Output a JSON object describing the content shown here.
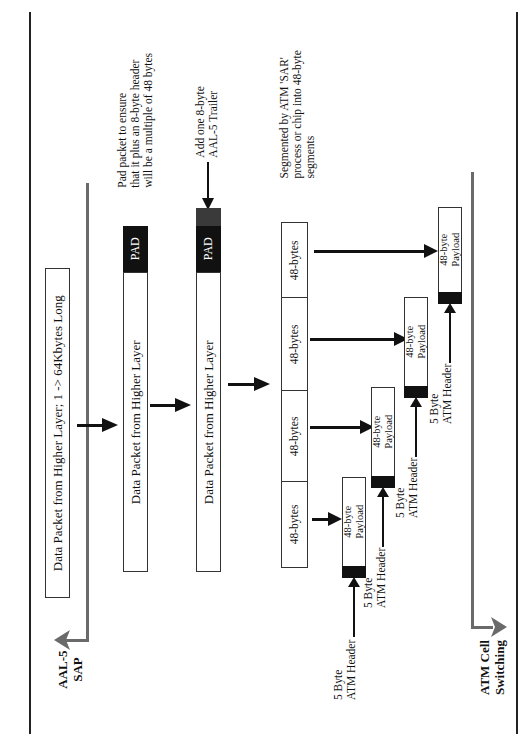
{
  "diagram": {
    "type": "AAL-5 segmentation and reassembly flow (rotated 90° counter-clockwise)",
    "orientation": "rotated-ccw",
    "endpoints": {
      "top": {
        "label_line1": "AAL-5",
        "label_line2": "SAP"
      },
      "bottom": {
        "label_line1": "ATM Cell",
        "label_line2": "Switching"
      }
    },
    "annotations": {
      "pad_note": {
        "line1": "Pad packet to ensure",
        "line2": "that it plus an 8-byte header",
        "line3": "will be a multiple of 48 bytes"
      },
      "trailer_note": {
        "line1": "Add one 8-byte",
        "line2": "AAL-5 Trailer"
      },
      "sar_note": {
        "line1": "Segmented by ATM 'SAR'",
        "line2": "process or chip into 48-byte",
        "line3": "segments"
      }
    },
    "stages": [
      {
        "id": "original",
        "label": "Data Packet from Higher Layer; 1 -> 64Kbytes Long"
      },
      {
        "id": "padded",
        "label": "Data Packet from Higher Layer",
        "pad_label": "PAD"
      },
      {
        "id": "trailered",
        "label": "Data Packet from Higher Layer",
        "pad_label": "PAD",
        "trailer": "AAL-5 Trailer"
      }
    ],
    "segments": [
      {
        "label": "48-bytes"
      },
      {
        "label": "48-bytes"
      },
      {
        "label": "48-bytes"
      },
      {
        "label": "48-bytes"
      }
    ],
    "cells": [
      {
        "payload_line1": "48-byte",
        "payload_line2": "Payload",
        "header_line1": "5 Byte",
        "header_line2": "ATM Header"
      },
      {
        "payload_line1": "48-byte",
        "payload_line2": "Payload",
        "header_line1": "5 Byte",
        "header_line2": "ATM Header"
      },
      {
        "payload_line1": "48-byte",
        "payload_line2": "Payload",
        "header_line1": "5 Byte",
        "header_line2": "ATM Header"
      },
      {
        "payload_line1": "48-byte",
        "payload_line2": "Payload",
        "header_line1": "5 Byte",
        "header_line2": "ATM Header"
      }
    ],
    "colors": {
      "line": "#222222",
      "flow_line": "#6a6a6a",
      "pad": "#111111",
      "trailer": "#3a3a3a"
    }
  }
}
